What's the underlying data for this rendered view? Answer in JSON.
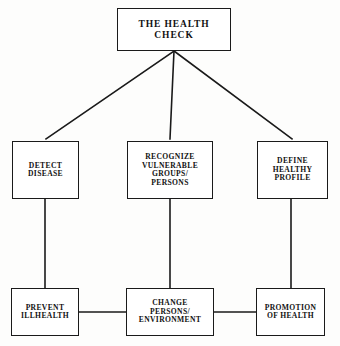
{
  "diagram": {
    "title": "The Health Check",
    "type": "flow-chart",
    "background_color": "#fdfdfc",
    "line_color": "#1a1a1a",
    "text_color": "#121212",
    "nodes": {
      "root": {
        "label": "THE HEALTH CHECK"
      },
      "detect": {
        "label": "DETECT\nDISEASE"
      },
      "recognize": {
        "label": "RECOGNIZE\nVULNERABLE\nGROUPS/\nPERSONS"
      },
      "define": {
        "label": "DEFINE\nHEALTHY\nPROFILE"
      },
      "prevent": {
        "label": "PREVENT\nILLHEALTH"
      },
      "change": {
        "label": "CHANGE\nPERSONS/\nENVIRONMENT"
      },
      "promotion": {
        "label": "PROMOTION\nOF HEALTH"
      }
    },
    "edges": [
      {
        "from": "root",
        "to": "detect",
        "style": "diagonal"
      },
      {
        "from": "root",
        "to": "recognize",
        "style": "vertical"
      },
      {
        "from": "root",
        "to": "define",
        "style": "diagonal"
      },
      {
        "from": "detect",
        "to": "prevent",
        "style": "vertical"
      },
      {
        "from": "recognize",
        "to": "change",
        "style": "vertical"
      },
      {
        "from": "define",
        "to": "promotion",
        "style": "vertical"
      },
      {
        "from": "prevent",
        "to": "change",
        "style": "horizontal"
      },
      {
        "from": "change",
        "to": "promotion",
        "style": "horizontal"
      }
    ]
  }
}
